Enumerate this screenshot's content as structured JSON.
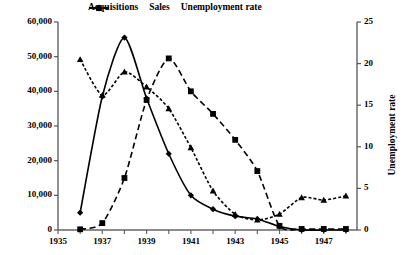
{
  "chart_data": {
    "type": "line",
    "title": "",
    "xlabel": "",
    "ylabel": "Number of sales and acquisitions",
    "ylabel_secondary": "Unemployment rate",
    "x": [
      1936,
      1937,
      1938,
      1939,
      1940,
      1941,
      1942,
      1943,
      1944,
      1945,
      1946,
      1947,
      1948
    ],
    "xlim": [
      1935,
      1948.5
    ],
    "xticks": [
      1935,
      1936,
      1937,
      1938,
      1939,
      1940,
      1941,
      1942,
      1943,
      1944,
      1945,
      1946,
      1947,
      1948
    ],
    "xticklabels": [
      "1935",
      "",
      "1937",
      "",
      "1939",
      "",
      "1941",
      "",
      "1943",
      "",
      "1945",
      "",
      "1947",
      ""
    ],
    "ylim": [
      0,
      60000
    ],
    "yticks": [
      0,
      10000,
      20000,
      30000,
      40000,
      50000,
      60000
    ],
    "yticklabels": [
      "0",
      "10,000",
      "20,000",
      "30,000",
      "40,000",
      "50,000",
      "60,000"
    ],
    "ylim_secondary": [
      0,
      25
    ],
    "yticks_secondary": [
      0,
      5,
      10,
      15,
      20,
      25
    ],
    "yticklabels_secondary": [
      "0",
      "5",
      "10",
      "15",
      "20",
      "25"
    ],
    "grid": false,
    "legend_position": "top-center",
    "series": [
      {
        "name": "Acquisitions",
        "axis": "left",
        "line_style": "solid",
        "marker": "diamond",
        "color": "#000000",
        "values": [
          5000,
          38500,
          55500,
          38000,
          22000,
          10000,
          6000,
          4000,
          3200,
          1000,
          0,
          0,
          0
        ]
      },
      {
        "name": "Sales",
        "axis": "left",
        "line_style": "dashed",
        "marker": "square",
        "color": "#000000",
        "values": [
          200,
          2000,
          15000,
          37500,
          49500,
          40000,
          33500,
          26000,
          17000,
          1200,
          300,
          300,
          300
        ]
      },
      {
        "name": "Unemployment rate",
        "axis": "right",
        "line_style": "dotted",
        "marker": "triangle",
        "color": "#000000",
        "values": [
          20.5,
          16.2,
          19.0,
          17.2,
          14.6,
          9.9,
          4.7,
          1.9,
          1.2,
          1.9,
          3.9,
          3.6,
          4.1
        ]
      }
    ]
  },
  "legend": {
    "items": [
      {
        "label": "Acquisitions"
      },
      {
        "label": "Sales"
      },
      {
        "label": "Unemployment rate"
      }
    ]
  }
}
